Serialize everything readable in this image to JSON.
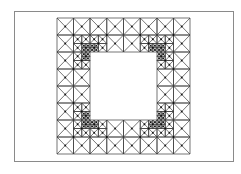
{
  "figure": {
    "frame": {
      "x": 14,
      "y": 11,
      "width": 220,
      "height": 151,
      "border_color": "#8a8a8a"
    },
    "line_color": "#3a3a3a",
    "node_color": "#111111",
    "background": "#ffffff"
  },
  "mesh": {
    "description": "Triangular finite-element mesh of a square domain with a square hole, refined toward the four re-entrant corners",
    "grid_x": [
      57,
      90,
      123.5,
      157,
      190
    ],
    "grid_y": [
      18,
      52,
      86,
      120,
      154
    ],
    "hole": {
      "col_start": 1,
      "col_end": 3,
      "row_start": 1,
      "row_end": 3
    },
    "refinement_corners": [
      {
        "name": "top-left",
        "x": 90,
        "y": 52,
        "levels": 3
      },
      {
        "name": "top-right",
        "x": 157,
        "y": 52,
        "levels": 3
      },
      {
        "name": "bottom-left",
        "x": 90,
        "y": 120,
        "levels": 3
      },
      {
        "name": "bottom-right",
        "x": 157,
        "y": 120,
        "levels": 3
      }
    ]
  }
}
